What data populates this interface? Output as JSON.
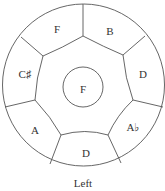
{
  "diagram": {
    "caption": "Left",
    "center_note": "F",
    "outer_notes": [
      {
        "label": "F",
        "x": 57,
        "y": 33
      },
      {
        "label": "B",
        "x": 110,
        "y": 35
      },
      {
        "label": "D",
        "x": 143,
        "y": 78
      },
      {
        "label": "A♭",
        "x": 133,
        "y": 131
      },
      {
        "label": "D",
        "x": 86,
        "y": 157
      },
      {
        "label": "A",
        "x": 35,
        "y": 134
      },
      {
        "label": "C♯",
        "x": 25,
        "y": 78
      }
    ],
    "colors": {
      "stroke": "#555555",
      "text": "#333333",
      "background": "#ffffff"
    }
  }
}
